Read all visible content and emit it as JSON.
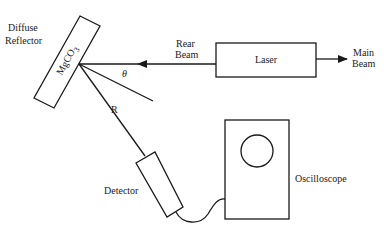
{
  "diagram": {
    "reflector": {
      "label_line1": "Diffuse",
      "label_line2": "Reflector",
      "material": "MgCO",
      "material_subscript": "3"
    },
    "laser": {
      "label": "Laser"
    },
    "rear_beam": {
      "label_line1": "Rear",
      "label_line2": "Beam"
    },
    "main_beam": {
      "label_line1": "Main",
      "label_line2": "Beam"
    },
    "angle_label": "θ",
    "distance_label": "R",
    "detector": {
      "label": "Detector"
    },
    "oscilloscope": {
      "label": "Oscilloscope"
    }
  }
}
